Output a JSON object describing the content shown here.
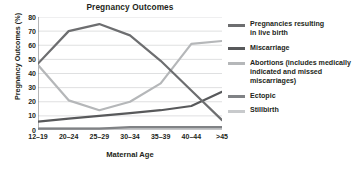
{
  "chart_data": {
    "type": "line",
    "title": "Pregnancy Outcomes",
    "xlabel": "Maternal Age",
    "ylabel": "Pregnancy Outcomes (%)",
    "categories": [
      "12–19",
      "20–24",
      "25–29",
      "30–34",
      "35–39",
      "40–44",
      ">45"
    ],
    "ylim": [
      0,
      80
    ],
    "yticks": [
      0,
      10,
      20,
      30,
      40,
      50,
      60,
      70,
      80
    ],
    "grid": "horizontal",
    "legend_position": "right",
    "series": [
      {
        "name": "Pregnancies resulting\nin live birth",
        "color": "#6d6e70",
        "values": [
          47,
          70,
          75,
          67,
          49,
          28,
          7
        ]
      },
      {
        "name": "Miscarriage",
        "color": "#58595b",
        "values": [
          6,
          8,
          10,
          12,
          14,
          17,
          27
        ]
      },
      {
        "name": "Abortions (includes medically\nindicated and missed\nmiscarriages)",
        "color": "#b5b7b9",
        "values": [
          46,
          21,
          14,
          20,
          33,
          61,
          63
        ]
      },
      {
        "name": "Ectopic",
        "color": "#808285",
        "values": [
          1,
          1,
          1,
          2,
          2,
          2,
          2
        ]
      },
      {
        "name": "Stillbirth",
        "color": "#c8cacc",
        "values": [
          1,
          1,
          1,
          1,
          1,
          1,
          1
        ]
      }
    ]
  },
  "colors": {
    "axis": "#6d6e70",
    "grid": "#c9cbcd",
    "text": "#231f20",
    "background": "#ffffff"
  }
}
